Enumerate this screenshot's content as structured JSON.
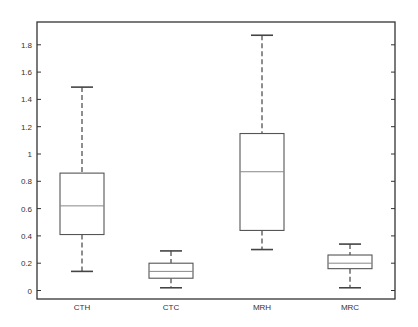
{
  "chart_data": {
    "type": "box",
    "title": "",
    "xlabel": "",
    "ylabel": "",
    "ylim": [
      -0.02,
      1.98
    ],
    "yticks": [
      0,
      0.2,
      0.4,
      0.6,
      0.8,
      1,
      1.2,
      1.4,
      1.6,
      1.8
    ],
    "ytick_labels": [
      "0",
      "0.2",
      "0.4",
      "0.6",
      "0.8",
      "1",
      "1.2",
      "1.4",
      "1.6",
      "1.8"
    ],
    "grid": false,
    "legend": null,
    "categories": [
      "CTH",
      "CTC",
      "MRH",
      "MRC"
    ],
    "series": [
      {
        "name": "CTH",
        "whisker_low": 0.14,
        "q1": 0.41,
        "median": 0.62,
        "q3": 0.86,
        "whisker_high": 1.49
      },
      {
        "name": "CTC",
        "whisker_low": 0.02,
        "q1": 0.09,
        "median": 0.14,
        "q3": 0.2,
        "whisker_high": 0.29
      },
      {
        "name": "MRH",
        "whisker_low": 0.3,
        "q1": 0.44,
        "median": 0.87,
        "q3": 1.15,
        "whisker_high": 1.87
      },
      {
        "name": "MRC",
        "whisker_low": 0.02,
        "q1": 0.16,
        "median": 0.2,
        "q3": 0.26,
        "whisker_high": 0.34
      }
    ],
    "colors": {
      "axis": "#333333",
      "box": "#555555",
      "median": "#888888",
      "whisker": "#444444"
    }
  }
}
